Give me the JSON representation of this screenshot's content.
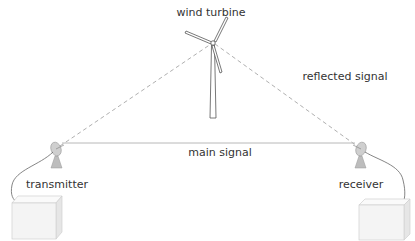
{
  "diagram": {
    "labels": {
      "wind_turbine": "wind turbine",
      "reflected_signal": "reflected signal",
      "main_signal": "main signal",
      "transmitter": "transmitter",
      "receiver": "receiver"
    },
    "colors": {
      "main_line": "#b8b8b8",
      "reflected_line": "#b0b0b0",
      "turbine_stroke": "#555555",
      "antenna_fill": "#c8c8c8",
      "box_fill": "#f4f4f4",
      "box_stroke": "#d0d0d0",
      "text": "#333333"
    }
  }
}
